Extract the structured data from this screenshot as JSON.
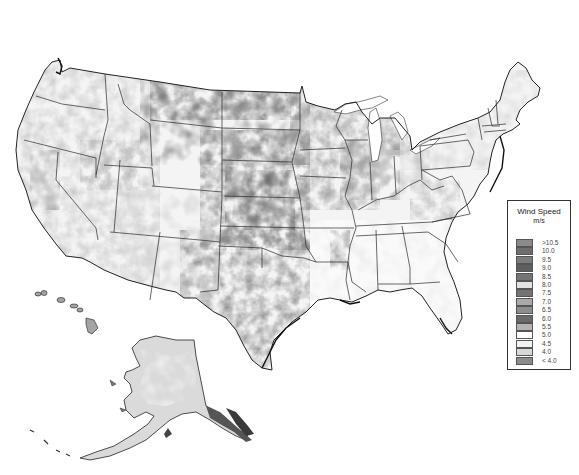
{
  "map": {
    "subject": "United States wind speed map",
    "regions": [
      "Contiguous United States",
      "Alaska",
      "Hawaii"
    ],
    "style": "grayscale"
  },
  "legend": {
    "title": "Wind Speed",
    "unit": "m/s",
    "items": [
      {
        "label": ">10.5",
        "color": "#8a8a8a"
      },
      {
        "label": "10.0",
        "color": "#6e6e6e"
      },
      {
        "label": "9.5",
        "color": "#7c7c7c"
      },
      {
        "label": "9.0",
        "color": "#5e5e5e"
      },
      {
        "label": "8.5",
        "color": "#757575"
      },
      {
        "label": "8.0",
        "color": "#e2e2e2"
      },
      {
        "label": "7.5",
        "color": "#737373"
      },
      {
        "label": "7.0",
        "color": "#a9a9a9"
      },
      {
        "label": "6.5",
        "color": "#8d8d8d"
      },
      {
        "label": "6.0",
        "color": "#6a6a6a"
      },
      {
        "label": "5.5",
        "color": "#b4b4b4"
      },
      {
        "label": "5.0",
        "color": "#ffffff"
      },
      {
        "label": "4.5",
        "color": "#f2f2f2"
      },
      {
        "label": "4.0",
        "color": "#d8d8d8"
      },
      {
        "label": "< 4.0",
        "color": "#8c8c8c"
      }
    ]
  }
}
